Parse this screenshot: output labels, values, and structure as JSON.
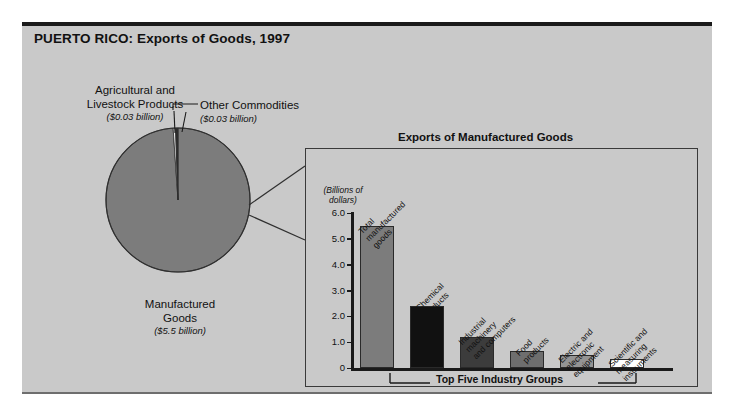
{
  "figure": {
    "title": "PUERTO RICO: Exports of Goods, 1997"
  },
  "pie": {
    "labels": {
      "agricultural": {
        "name_line1": "Agricultural and",
        "name_line2": "Livestock Products",
        "value": "($0.03 billion)"
      },
      "other": {
        "name": "Other Commodities",
        "value": "($0.03 billion)"
      },
      "manufactured": {
        "name_line1": "Manufactured",
        "name_line2": "Goods",
        "value": "($5.5 billion)"
      }
    }
  },
  "inset": {
    "title": "Exports of Manufactured Goods",
    "axis_caption_line1": "(Billions of",
    "axis_caption_line2": "dollars)",
    "bracket_label": "Top Five Industry Groups"
  },
  "chart_data": [
    {
      "type": "pie",
      "title": "PUERTO RICO: Exports of Goods, 1997",
      "unit": "billions of dollars",
      "slices": [
        {
          "label": "Manufactured Goods",
          "value": 5.5,
          "display_value": "($5.5 billion)",
          "color": "#7c7c7c"
        },
        {
          "label": "Agricultural and Livestock Products",
          "value": 0.03,
          "display_value": "($0.03 billion)",
          "color": "#f2f2f2"
        },
        {
          "label": "Other Commodities",
          "value": 0.03,
          "display_value": "($0.03 billion)",
          "color": "#2b2b2b"
        }
      ],
      "legend": "labels with leader lines"
    },
    {
      "type": "bar",
      "title": "Exports of Manufactured Goods",
      "ylabel": "(Billions of dollars)",
      "xlabel": "Top Five Industry Groups",
      "ylim": [
        0,
        6.0
      ],
      "yticks": [
        "0",
        "1.0",
        "2.0",
        "3.0",
        "4.0",
        "5.0",
        "6.0"
      ],
      "grid": false,
      "categories": [
        "Total manufactured goods",
        "Chemical products",
        "Industrial machinery and computers",
        "Food products",
        "Electric and electronic equipment",
        "Scientific and measuring instruments"
      ],
      "values": [
        5.5,
        2.4,
        1.2,
        0.65,
        0.5,
        0.35
      ],
      "colors": [
        "#7c7c7c",
        "#111111",
        "#3c3c3c",
        "#6e6e6e",
        "#949494",
        "#ffffff"
      ]
    }
  ],
  "bars": [
    {
      "label_lines": [
        "Total",
        "manufactured",
        "goods"
      ],
      "value": 5.5,
      "color": "#7c7c7c"
    },
    {
      "label_lines": [
        "Chemical",
        "products"
      ],
      "value": 2.4,
      "color": "#111111"
    },
    {
      "label_lines": [
        "Industrial",
        "machinery",
        "and computers"
      ],
      "value": 1.2,
      "color": "#3c3c3c"
    },
    {
      "label_lines": [
        "Food",
        "products"
      ],
      "value": 0.65,
      "color": "#6e6e6e"
    },
    {
      "label_lines": [
        "Electric and",
        "electronic",
        "equipment"
      ],
      "value": 0.5,
      "color": "#949494"
    },
    {
      "label_lines": [
        "Scientific and",
        "measuring",
        "instruments"
      ],
      "value": 0.35,
      "color": "#ffffff"
    }
  ],
  "yticks": [
    {
      "label": "6.0",
      "value": 6.0
    },
    {
      "label": "5.0",
      "value": 5.0
    },
    {
      "label": "4.0",
      "value": 4.0
    },
    {
      "label": "3.0",
      "value": 3.0
    },
    {
      "label": "2.0",
      "value": 2.0
    },
    {
      "label": "1.0",
      "value": 1.0
    },
    {
      "label": "0",
      "value": 0
    }
  ]
}
